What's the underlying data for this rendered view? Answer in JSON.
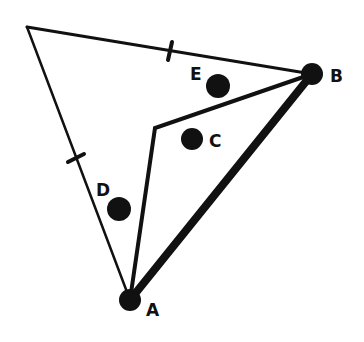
{
  "diagram": {
    "type": "geometry-triangle",
    "stroke_color": "#111111",
    "background": "#ffffff",
    "vertices": {
      "top_left": {
        "x": 27,
        "y": 27
      },
      "B": {
        "x": 312,
        "y": 74,
        "label": "B"
      },
      "A": {
        "x": 130,
        "y": 300,
        "label": "A"
      },
      "inner": {
        "x": 155,
        "y": 128
      }
    },
    "points": [
      {
        "id": "E",
        "label": "E",
        "x": 218,
        "y": 86
      },
      {
        "id": "C",
        "label": "C",
        "x": 192,
        "y": 139
      },
      {
        "id": "D",
        "label": "D",
        "x": 119,
        "y": 209
      }
    ],
    "labels": {
      "A": "A",
      "B": "B",
      "C": "C",
      "D": "D",
      "E": "E"
    },
    "tick_marks": [
      {
        "edge": "top_left-B",
        "x": 170,
        "y": 51
      },
      {
        "edge": "top_left-A",
        "x": 74,
        "y": 158
      }
    ],
    "thick_edge": "A-B"
  }
}
